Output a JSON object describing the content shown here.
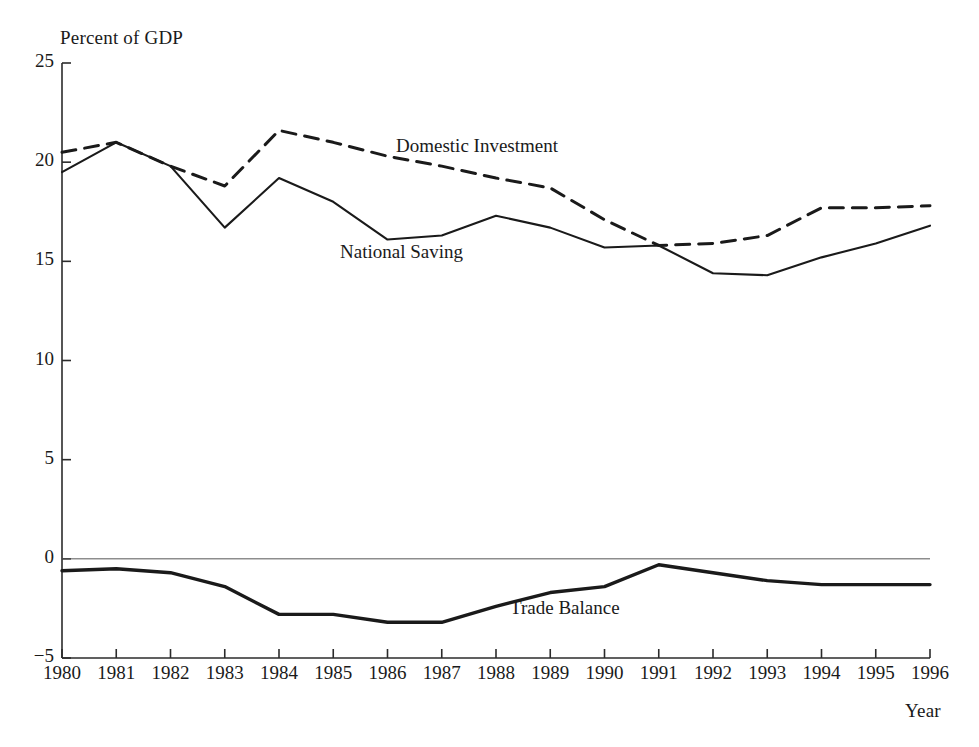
{
  "figure": {
    "y_axis_title": "Percent of GDP",
    "x_axis_title": "Year",
    "axis_color": "#2b2b2b",
    "line_color": "#1a1a1a",
    "background": "#ffffff"
  },
  "chart_data": {
    "type": "line",
    "title": "",
    "xlabel": "Year",
    "ylabel": "Percent of GDP",
    "xlim": [
      1980,
      1996
    ],
    "ylim": [
      -5,
      25
    ],
    "yticks": [
      25,
      20,
      15,
      10,
      5,
      0,
      -5
    ],
    "ytick_labels": [
      "25",
      "20",
      "15",
      "10",
      "5",
      "0",
      "−5"
    ],
    "x": [
      1980,
      1981,
      1982,
      1983,
      1984,
      1985,
      1986,
      1987,
      1988,
      1989,
      1990,
      1991,
      1992,
      1993,
      1994,
      1995,
      1996
    ],
    "xtick_labels": [
      "1980",
      "1981",
      "1982",
      "1983",
      "1984",
      "1985",
      "1986",
      "1987",
      "1988",
      "1989",
      "1990",
      "1991",
      "1992",
      "1993",
      "1994",
      "1995",
      "1996"
    ],
    "grid": false,
    "legend": "inline-annotations",
    "zero_line": true,
    "series": [
      {
        "name": "Domestic Investment",
        "style": "dashed",
        "label_position": "inline",
        "values": [
          20.5,
          21.0,
          19.8,
          18.8,
          21.6,
          21.0,
          20.3,
          19.8,
          19.2,
          18.7,
          17.1,
          15.8,
          15.9,
          16.3,
          17.7,
          17.7,
          17.8
        ]
      },
      {
        "name": "National Saving",
        "style": "solid",
        "label_position": "inline",
        "values": [
          19.5,
          21.0,
          19.8,
          16.7,
          19.2,
          18.0,
          16.1,
          16.3,
          17.3,
          16.7,
          15.7,
          15.8,
          14.4,
          14.3,
          15.2,
          15.9,
          16.8
        ]
      },
      {
        "name": "Trade Balance",
        "style": "solid-thick",
        "label_position": "inline",
        "values": [
          -0.6,
          -0.5,
          -0.7,
          -1.4,
          -2.8,
          -2.8,
          -3.2,
          -3.2,
          -2.4,
          -1.7,
          -1.4,
          -0.3,
          -0.7,
          -1.1,
          -1.3,
          -1.3,
          -1.3
        ]
      }
    ]
  }
}
